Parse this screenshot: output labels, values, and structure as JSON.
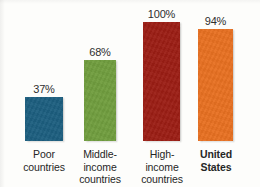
{
  "chart_data": {
    "type": "bar",
    "title": "",
    "subtitle": "",
    "xlabel": "",
    "ylabel": "",
    "ylim": [
      0,
      100
    ],
    "grid": false,
    "legend": false,
    "value_suffix": "%",
    "categories": [
      "Poor countries",
      "Middle-income countries",
      "High-income countries",
      "United States"
    ],
    "category_lines": [
      [
        "Poor",
        "countries"
      ],
      [
        "Middle-",
        "income",
        "countries"
      ],
      [
        "High-",
        "income",
        "countries"
      ],
      [
        "United",
        "States"
      ]
    ],
    "values": [
      37,
      68,
      100,
      94
    ],
    "value_labels": [
      "37%",
      "68%",
      "100%",
      "94%"
    ],
    "colors": [
      "#1d5f80",
      "#719e3f",
      "#9c1e15",
      "#e87122"
    ],
    "highlight_index": 3
  },
  "bars": [
    {
      "category": "Poor countries",
      "line1": "Poor",
      "line2": "countries",
      "line3": "",
      "value": 37,
      "value_label": "37%",
      "color": "#1d5f80",
      "bold": false
    },
    {
      "category": "Middle-income countries",
      "line1": "Middle-",
      "line2": "income",
      "line3": "countries",
      "value": 68,
      "value_label": "68%",
      "color": "#719e3f",
      "bold": false
    },
    {
      "category": "High-income countries",
      "line1": "High-",
      "line2": "income",
      "line3": "countries",
      "value": 100,
      "value_label": "100%",
      "color": "#9c1e15",
      "bold": false
    },
    {
      "category": "United States",
      "line1": "United",
      "line2": "States",
      "line3": "",
      "value": 94,
      "value_label": "94%",
      "color": "#e87122",
      "bold": true
    }
  ],
  "style": {
    "background": "#fdfdfb",
    "text_color": "#262626"
  }
}
